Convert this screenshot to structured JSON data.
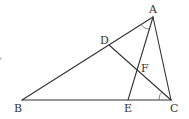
{
  "diagram": {
    "type": "triangle-geometry",
    "points": {
      "A": {
        "label": "A",
        "x": 153,
        "y": 17,
        "lx": 149,
        "ly": 13
      },
      "B": {
        "label": "B",
        "x": 22,
        "y": 100,
        "lx": 14,
        "ly": 112
      },
      "C": {
        "label": "C",
        "x": 171,
        "y": 100,
        "lx": 170,
        "ly": 112
      },
      "D": {
        "label": "D",
        "x": 109,
        "y": 45,
        "lx": 100,
        "ly": 44
      },
      "E": {
        "label": "E",
        "x": 128,
        "y": 100,
        "lx": 124,
        "ly": 112
      },
      "F": {
        "label": "F",
        "x": 138,
        "y": 72,
        "lx": 141,
        "ly": 72
      }
    },
    "segments": [
      {
        "name": "AB",
        "from": "A",
        "to": "B"
      },
      {
        "name": "BC",
        "from": "B",
        "to": "C"
      },
      {
        "name": "CA",
        "from": "C",
        "to": "A"
      },
      {
        "name": "AE",
        "from": "A",
        "to": "E"
      },
      {
        "name": "CD",
        "from": "C",
        "to": "D"
      }
    ],
    "angle_marks": [
      {
        "vertex": "A",
        "between": [
          "AB",
          "AE"
        ]
      },
      {
        "vertex": "C",
        "between": [
          "CB",
          "CD"
        ]
      }
    ],
    "stray_mark": {
      "x": 1,
      "y": 58
    }
  }
}
